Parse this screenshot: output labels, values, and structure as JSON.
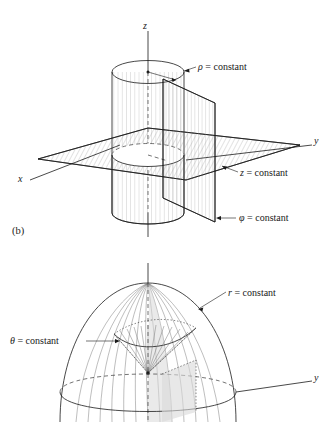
{
  "figure": {
    "panel_label_b": "(b)",
    "background_color": "#ffffff",
    "line_color": "#1a1a1a",
    "hatch_color": "#8a8a8a",
    "shade_color": "#d8d8d8"
  },
  "panel_top": {
    "name": "cylindrical-coordinates-panel",
    "axes": [
      {
        "name": "z-axis",
        "label": "z"
      },
      {
        "name": "y-axis",
        "label": "y"
      },
      {
        "name": "x-axis",
        "label": "x"
      }
    ],
    "annotations": [
      {
        "name": "rho-constant-label",
        "symbol": "ρ",
        "text": " = constant",
        "full": "ρ = constant",
        "surface": "cylinder"
      },
      {
        "name": "z-constant-label",
        "symbol": "z",
        "text": " = constant",
        "full": "z = constant",
        "surface": "horizontal-plane"
      },
      {
        "name": "phi-constant-label",
        "symbol": "φ",
        "text": " = constant",
        "full": "φ = constant",
        "surface": "vertical-half-plane"
      }
    ]
  },
  "panel_bottom": {
    "name": "spherical-coordinates-panel",
    "axes": [
      {
        "name": "z-axis",
        "label": ""
      },
      {
        "name": "y-axis",
        "label": "y"
      }
    ],
    "annotations": [
      {
        "name": "r-constant-label",
        "symbol": "r",
        "text": " = constant",
        "full": "r = constant",
        "surface": "sphere"
      },
      {
        "name": "theta-constant-label",
        "symbol": "θ",
        "text": " = constant",
        "full": "θ = constant",
        "surface": "cone"
      }
    ]
  }
}
